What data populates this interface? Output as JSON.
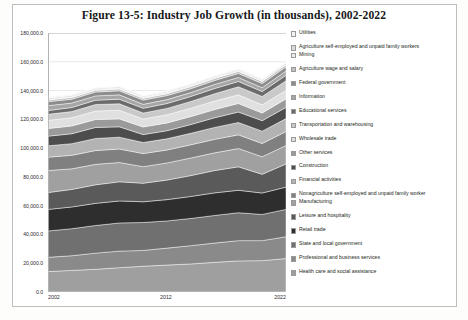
{
  "figure": {
    "title": "Figure 13-5: Industry Job Growth (in thousands), 2002-2022"
  },
  "axes": {
    "y_ticks": [
      "180,000.0",
      "160,000.0",
      "140,000.0",
      "120,000.0",
      "100,000.0",
      "80,000.0",
      "60,000.0",
      "40,000.0",
      "20,000.0",
      "0.0"
    ],
    "x_ticks": [
      "2002",
      "2012",
      "2022"
    ]
  },
  "legend": {
    "items": [
      {
        "label": "Utilities",
        "color": "#f2f2f2"
      },
      {
        "label": "Agriculture self-employed and unpaid family workers",
        "color": "#d9d9d9"
      },
      {
        "label": "Mining",
        "color": "#ededed"
      },
      {
        "label": "Agriculture wage and salary",
        "color": "#bfbfbf"
      },
      {
        "label": "Federal government",
        "color": "#8c8c8c"
      },
      {
        "label": "Information",
        "color": "#a6a6a6"
      },
      {
        "label": "Educational services",
        "color": "#6b6b6b"
      },
      {
        "label": "Transportation and warehousing",
        "color": "#c9c9c9"
      },
      {
        "label": "Wholesale trade",
        "color": "#e0e0e0"
      },
      {
        "label": "Other services",
        "color": "#9a9a9a"
      },
      {
        "label": "Construction",
        "color": "#4d4d4d"
      },
      {
        "label": "Financial activities",
        "color": "#b3b3b3"
      },
      {
        "label": "Nonagriculture self-employed and unpaid family worker",
        "color": "#808080"
      },
      {
        "label": "Manufacturing",
        "color": "#a0a0a0"
      },
      {
        "label": "Leisure and hospitality",
        "color": "#5a5a5a"
      },
      {
        "label": "Retail trade",
        "color": "#2e2e2e"
      },
      {
        "label": "State and local government",
        "color": "#707070"
      },
      {
        "label": "Professional and business services",
        "color": "#8a8a8a"
      },
      {
        "label": "Health care and social assistance",
        "color": "#9f9f9f"
      }
    ]
  },
  "chart_data": {
    "type": "area",
    "title": "Figure 13-5: Industry Job Growth (in thousands), 2002-2022",
    "xlabel": "",
    "ylabel": "",
    "ylim": [
      0,
      180000
    ],
    "ytick_interval": 20000,
    "grid": true,
    "legend_position": "right",
    "stacked": true,
    "x": [
      2002,
      2004,
      2006,
      2008,
      2010,
      2012,
      2014,
      2016,
      2018,
      2020,
      2022
    ],
    "series": [
      {
        "name": "Health care and social assistance",
        "color": "#9f9f9f",
        "values": [
          14200,
          15000,
          15800,
          16900,
          17900,
          18700,
          19500,
          20600,
          21600,
          21800,
          23200
        ]
      },
      {
        "name": "Professional and business services",
        "color": "#8a8a8a",
        "values": [
          9900,
          10200,
          11200,
          11500,
          11000,
          11800,
          12700,
          13400,
          14100,
          13900,
          15200
        ]
      },
      {
        "name": "State and local government",
        "color": "#707070",
        "values": [
          18300,
          18800,
          19200,
          19600,
          19400,
          18900,
          18900,
          19200,
          19400,
          18200,
          19000
        ]
      },
      {
        "name": "Retail trade",
        "color": "#2e2e2e",
        "values": [
          15000,
          15100,
          15400,
          15300,
          14400,
          14800,
          15300,
          15700,
          15600,
          14900,
          15500
        ]
      },
      {
        "name": "Leisure and hospitality",
        "color": "#5a5a5a",
        "values": [
          11700,
          12200,
          12900,
          13300,
          12900,
          13600,
          14500,
          15500,
          16300,
          13000,
          16100
        ]
      },
      {
        "name": "Manufacturing",
        "color": "#a0a0a0",
        "values": [
          15300,
          14300,
          14200,
          13400,
          11500,
          11900,
          12200,
          12300,
          12700,
          12200,
          12800
        ]
      },
      {
        "name": "Nonagriculture self-employed and unpaid family worker",
        "color": "#808080",
        "values": [
          9300,
          9400,
          9600,
          9400,
          9100,
          9000,
          9200,
          9400,
          9500,
          9200,
          9700
        ]
      },
      {
        "name": "Financial activities",
        "color": "#b3b3b3",
        "values": [
          7900,
          8100,
          8400,
          8200,
          7700,
          7800,
          8000,
          8300,
          8600,
          8600,
          9000
        ]
      },
      {
        "name": "Construction",
        "color": "#4d4d4d",
        "values": [
          6700,
          6900,
          7700,
          7200,
          5500,
          5600,
          6100,
          6700,
          7300,
          7300,
          7800
        ]
      },
      {
        "name": "Other services",
        "color": "#9a9a9a",
        "values": [
          5300,
          5400,
          5500,
          5500,
          5300,
          5400,
          5500,
          5700,
          5900,
          5300,
          5900
        ]
      },
      {
        "name": "Wholesale trade",
        "color": "#e0e0e0",
        "values": [
          5700,
          5700,
          5900,
          6000,
          5500,
          5700,
          5800,
          5900,
          6000,
          5700,
          6000
        ]
      },
      {
        "name": "Transportation and warehousing",
        "color": "#c9c9c9",
        "values": [
          4200,
          4300,
          4500,
          4500,
          4200,
          4400,
          4700,
          5100,
          5600,
          5800,
          6600
        ]
      },
      {
        "name": "Educational services",
        "color": "#6b6b6b",
        "values": [
          2600,
          2800,
          3000,
          3200,
          3300,
          3400,
          3500,
          3600,
          3700,
          3400,
          3800
        ]
      },
      {
        "name": "Information",
        "color": "#a6a6a6",
        "values": [
          3400,
          3100,
          3000,
          3000,
          2700,
          2700,
          2700,
          2800,
          2800,
          2700,
          3000
        ]
      },
      {
        "name": "Federal government",
        "color": "#8c8c8c",
        "values": [
          2800,
          2700,
          2700,
          2800,
          3000,
          2800,
          2700,
          2800,
          2800,
          2900,
          2900
        ]
      },
      {
        "name": "Agriculture wage and salary",
        "color": "#bfbfbf",
        "values": [
          1200,
          1200,
          1200,
          1200,
          1200,
          1300,
          1400,
          1400,
          1400,
          1400,
          1400
        ]
      },
      {
        "name": "Mining",
        "color": "#ededed",
        "values": [
          500,
          500,
          600,
          800,
          700,
          800,
          900,
          700,
          700,
          600,
          600
        ]
      },
      {
        "name": "Agriculture self-employed and unpaid family workers",
        "color": "#d9d9d9",
        "values": [
          900,
          900,
          800,
          800,
          800,
          800,
          800,
          800,
          800,
          800,
          800
        ]
      },
      {
        "name": "Utilities",
        "color": "#f2f2f2",
        "values": [
          600,
          600,
          550,
          550,
          550,
          550,
          550,
          550,
          550,
          550,
          550
        ]
      }
    ]
  }
}
